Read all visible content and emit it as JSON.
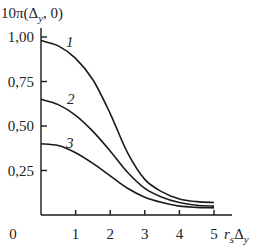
{
  "chart_data": {
    "type": "line",
    "title": "",
    "ylabel": "10π(Δy, 0)",
    "xlabel": "r_s Δy",
    "xlim": [
      0,
      5
    ],
    "ylim": [
      0,
      1.0
    ],
    "x_ticks": [
      "0",
      "1",
      "2",
      "3",
      "4",
      "5"
    ],
    "y_ticks": [
      "0,25",
      "0,50",
      "0,75",
      "1,00"
    ],
    "grid": false,
    "legend": "inline curve labels",
    "x": [
      0,
      0.5,
      1,
      1.5,
      2,
      2.5,
      3,
      3.5,
      4,
      4.5,
      5
    ],
    "series": [
      {
        "name": "1",
        "values": [
          0.98,
          0.95,
          0.88,
          0.76,
          0.57,
          0.35,
          0.2,
          0.13,
          0.09,
          0.075,
          0.07
        ]
      },
      {
        "name": "2",
        "values": [
          0.65,
          0.62,
          0.56,
          0.47,
          0.36,
          0.24,
          0.15,
          0.1,
          0.07,
          0.055,
          0.05
        ]
      },
      {
        "name": "3",
        "values": [
          0.4,
          0.39,
          0.35,
          0.29,
          0.22,
          0.15,
          0.1,
          0.07,
          0.05,
          0.043,
          0.04
        ]
      }
    ]
  },
  "labels": {
    "ylabel_prefix": "10π(Δ",
    "ylabel_sub": "y",
    "ylabel_suffix": ", 0)",
    "xlabel_r": "r",
    "xlabel_s": "s",
    "xlabel_delta": "Δ",
    "xlabel_y": "y",
    "origin": "0"
  }
}
